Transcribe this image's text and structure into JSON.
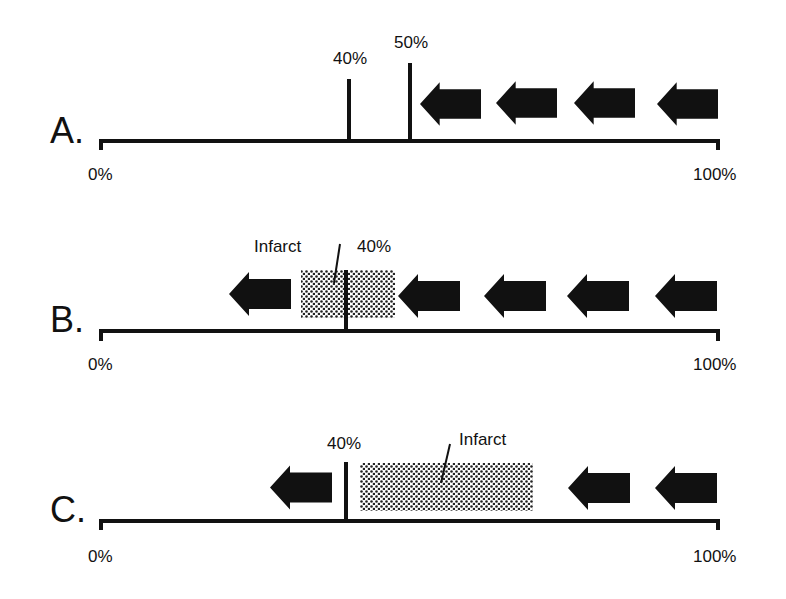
{
  "panels": [
    {
      "id": "A",
      "label": "A.",
      "axis_start": "0%",
      "axis_end": "100%",
      "markers": [
        {
          "label": "40%",
          "value": 40
        },
        {
          "label": "50%",
          "value": 50
        }
      ],
      "arrows_direction": "left",
      "arrow_count": 4
    },
    {
      "id": "B",
      "label": "B.",
      "axis_start": "0%",
      "axis_end": "100%",
      "markers": [
        {
          "label": "40%",
          "value": 40
        }
      ],
      "infarct_label": "Infarct",
      "arrows_direction": "left",
      "arrow_count": 5
    },
    {
      "id": "C",
      "label": "C.",
      "axis_start": "0%",
      "axis_end": "100%",
      "markers": [
        {
          "label": "40%",
          "value": 40
        }
      ],
      "infarct_label": "Infarct",
      "arrows_direction": "left",
      "arrow_count": 3
    }
  ],
  "colors": {
    "ink": "#111111",
    "background": "#ffffff",
    "infarct_fill": "#9a9a9a"
  }
}
